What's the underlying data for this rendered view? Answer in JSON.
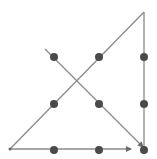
{
  "diagram": {
    "colors": {
      "background": "#ffffff",
      "dot": "#4a4a4a",
      "line": "#8a8a8a"
    },
    "dots": [
      {
        "x": 54,
        "y": 57
      },
      {
        "x": 99,
        "y": 57
      },
      {
        "x": 144,
        "y": 57
      },
      {
        "x": 54,
        "y": 104
      },
      {
        "x": 99,
        "y": 104
      },
      {
        "x": 144,
        "y": 104
      },
      {
        "x": 54,
        "y": 150
      },
      {
        "x": 99,
        "y": 150
      },
      {
        "x": 144,
        "y": 150
      }
    ],
    "path_segments": [
      {
        "from": [
          45,
          49
        ],
        "to": [
          143,
          147
        ],
        "arrow": true
      },
      {
        "from": [
          144,
          147
        ],
        "to": [
          144,
          12
        ],
        "arrow": false
      },
      {
        "from": [
          144,
          12
        ],
        "to": [
          10,
          149
        ],
        "arrow": false
      },
      {
        "from": [
          10,
          149
        ],
        "to": [
          131,
          149
        ],
        "arrow": true
      }
    ]
  }
}
